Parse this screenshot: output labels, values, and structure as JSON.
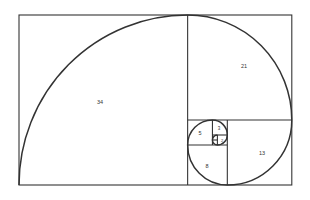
{
  "diagram": {
    "squares": [
      {
        "label": "34",
        "x": 0,
        "y": 0,
        "size": 34
      },
      {
        "label": "21",
        "x": 34,
        "y": 0,
        "size": 21
      },
      {
        "label": "13",
        "x": 42,
        "y": 21,
        "size": 13
      },
      {
        "label": "8",
        "x": 34,
        "y": 26,
        "size": 8
      },
      {
        "label": "5",
        "x": 34,
        "y": 21,
        "size": 5
      },
      {
        "label": "3",
        "x": 39,
        "y": 21,
        "size": 3
      },
      {
        "label": "2",
        "x": 40,
        "y": 24,
        "size": 2
      },
      {
        "label": "1",
        "x": 39,
        "y": 25,
        "size": 1
      },
      {
        "label": "1",
        "x": 39,
        "y": 24,
        "size": 1
      }
    ],
    "colors": {
      "stroke": "#333333",
      "background": "#ffffff"
    }
  }
}
